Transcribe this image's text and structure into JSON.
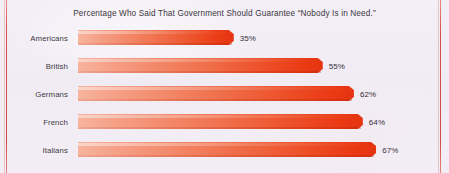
{
  "chart_data": {
    "type": "bar",
    "orientation": "horizontal",
    "title": "Percentage Who Said That Government Should Guarantee “Nobody Is in Need.”",
    "xlabel": "",
    "ylabel": "",
    "xlim": [
      0,
      100
    ],
    "grid": false,
    "legend": false,
    "categories": [
      "Americans",
      "British",
      "Germans",
      "French",
      "Italians"
    ],
    "values": [
      35,
      55,
      62,
      64,
      67
    ],
    "value_labels": [
      "35%",
      "55%",
      "62%",
      "64%",
      "67%"
    ],
    "bars": [
      {
        "category": "Americans",
        "value": 35,
        "label": "35%"
      },
      {
        "category": "British",
        "value": 55,
        "label": "55%"
      },
      {
        "category": "Germans",
        "value": 62,
        "label": "62%"
      },
      {
        "category": "French",
        "value": 64,
        "label": "64%"
      },
      {
        "category": "Italians",
        "value": 67,
        "label": "67%"
      }
    ],
    "colors": {
      "bar_gradient_start": "#f7b49e",
      "bar_gradient_end": "#e53410",
      "background": "#f2edf5",
      "text": "#3b3740",
      "edge_rule": "#d8524a"
    }
  }
}
